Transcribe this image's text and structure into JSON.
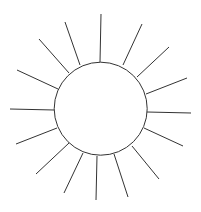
{
  "drawing": {
    "description": "Sun drawing: circle with 16 radiating lines",
    "stroke_color": "#333333",
    "background": "#ffffff",
    "circle": {
      "cx": 100.7,
      "cy": 108.7,
      "r": 46.5
    },
    "rays": [
      {
        "x1": 100,
        "y1": 62,
        "x2": 101,
        "y2": 14
      },
      {
        "x1": 123,
        "y1": 65,
        "x2": 142,
        "y2": 24
      },
      {
        "x1": 137,
        "y1": 77,
        "x2": 169,
        "y2": 47
      },
      {
        "x1": 146,
        "y1": 94,
        "x2": 187,
        "y2": 78
      },
      {
        "x1": 147,
        "y1": 112,
        "x2": 191,
        "y2": 113
      },
      {
        "x1": 144,
        "y1": 128,
        "x2": 183,
        "y2": 146
      },
      {
        "x1": 132,
        "y1": 146,
        "x2": 159,
        "y2": 179
      },
      {
        "x1": 114,
        "y1": 154,
        "x2": 128,
        "y2": 197
      },
      {
        "x1": 97,
        "y1": 156,
        "x2": 96,
        "y2": 200
      },
      {
        "x1": 83,
        "y1": 153,
        "x2": 64,
        "y2": 193
      },
      {
        "x1": 69,
        "y1": 143,
        "x2": 36,
        "y2": 174
      },
      {
        "x1": 57,
        "y1": 128,
        "x2": 16,
        "y2": 144
      },
      {
        "x1": 54,
        "y1": 110,
        "x2": 10,
        "y2": 109
      },
      {
        "x1": 58,
        "y1": 89,
        "x2": 17,
        "y2": 70
      },
      {
        "x1": 69,
        "y1": 73,
        "x2": 39,
        "y2": 39
      },
      {
        "x1": 80,
        "y1": 65,
        "x2": 65,
        "y2": 22
      }
    ]
  }
}
